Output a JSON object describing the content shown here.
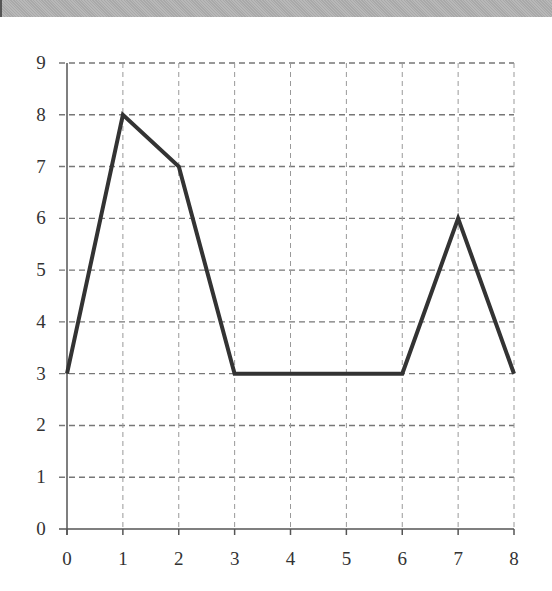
{
  "chart_data": {
    "type": "line",
    "title": "",
    "xlabel": "",
    "ylabel": "",
    "x": [
      0,
      1,
      2,
      3,
      4,
      5,
      6,
      7,
      8
    ],
    "series": [
      {
        "name": "line",
        "values": [
          3,
          8,
          7,
          3,
          3,
          3,
          3,
          6,
          3
        ],
        "color": "#333333"
      }
    ],
    "xlim": [
      0,
      8
    ],
    "ylim": [
      0,
      9
    ],
    "x_ticks": [
      "0",
      "1",
      "2",
      "3",
      "4",
      "5",
      "6",
      "7",
      "8"
    ],
    "y_ticks": [
      "0",
      "1",
      "2",
      "3",
      "4",
      "5",
      "6",
      "7",
      "8",
      "9"
    ],
    "grid": true,
    "legend": null
  },
  "colors": {
    "line": "#333333",
    "grid": "#777777",
    "axis": "#555555",
    "header_band": "#b0b0b0"
  }
}
